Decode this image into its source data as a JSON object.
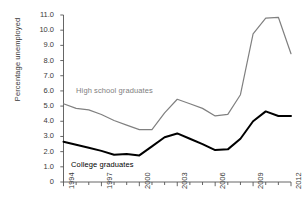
{
  "chart_data": {
    "type": "line",
    "title": "",
    "subtitle": "",
    "xlabel": "",
    "ylabel": "Percentage unemployed",
    "x": [
      1994,
      1995,
      1996,
      1997,
      1998,
      1999,
      2000,
      2001,
      2002,
      2003,
      2004,
      2005,
      2006,
      2007,
      2008,
      2009,
      2010,
      2011,
      2012
    ],
    "xlim": [
      1994,
      2012
    ],
    "ylim": [
      0,
      11
    ],
    "ytick_labels": [
      "0",
      "1.0",
      "2.0",
      "3.0",
      "4.0",
      "5.0",
      "6.0",
      "7.0",
      "8.0",
      "9.0",
      "10.0",
      "11.0"
    ],
    "ytick_values": [
      0,
      1,
      2,
      3,
      4,
      5,
      6,
      7,
      8,
      9,
      10,
      11
    ],
    "xtick_labels": [
      "1994",
      "1997",
      "2000",
      "2003",
      "2006",
      "2009",
      "2012"
    ],
    "xtick_values": [
      1994,
      1997,
      2000,
      2003,
      2006,
      2009,
      2012
    ],
    "xtick_minor_values": [
      1995,
      1996,
      1998,
      1999,
      2001,
      2002,
      2004,
      2005,
      2007,
      2008,
      2010,
      2011
    ],
    "grid": false,
    "legend_position": "inline-annotation",
    "series": [
      {
        "name": "High school graduates",
        "color": "#808080",
        "label_x": 1995.0,
        "label_y": 6.0,
        "values": [
          5.15,
          4.85,
          4.75,
          4.45,
          4.05,
          3.75,
          3.45,
          3.45,
          4.55,
          5.45,
          5.15,
          4.85,
          4.35,
          4.45,
          5.75,
          9.75,
          10.8,
          10.85,
          8.45
        ]
      },
      {
        "name": "College graduates",
        "color": "#000000",
        "label_x": 1994.6,
        "label_y": 1.15,
        "values": [
          2.65,
          2.45,
          2.25,
          2.05,
          1.8,
          1.85,
          1.75,
          2.35,
          2.95,
          3.2,
          2.85,
          2.5,
          2.1,
          2.15,
          2.85,
          4.0,
          4.65,
          4.35,
          4.35
        ]
      }
    ]
  },
  "axes": {
    "axis_color": "#555555",
    "tick_color": "#555555"
  }
}
